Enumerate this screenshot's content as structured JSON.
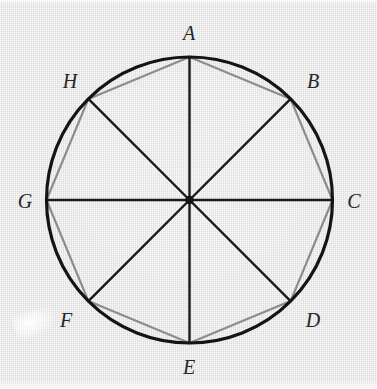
{
  "figure": {
    "background_color": "#e3e3e3",
    "circle": {
      "center_x": 189.5,
      "center_y": 200,
      "radius": 143,
      "stroke_color": "#141414",
      "stroke_width": 3.2
    },
    "radii": {
      "stroke_color": "#1a1a1a",
      "stroke_width": 2.4,
      "count": 8
    },
    "octagon": {
      "stroke_color": "#8c8c8c",
      "stroke_width": 2.2,
      "fill": "none",
      "sides": 8
    },
    "center_point": {
      "label": "",
      "x": 189.5,
      "y": 200,
      "radius": 4.2,
      "color": "#141414"
    },
    "vertices": [
      {
        "label": "A",
        "angle_deg": 90,
        "x": 189.5,
        "y": 57,
        "label_x": 189,
        "label_y": 33
      },
      {
        "label": "B",
        "angle_deg": 45,
        "x": 290.6,
        "y": 98.9,
        "label_x": 313,
        "label_y": 81
      },
      {
        "label": "C",
        "angle_deg": 0,
        "x": 332.5,
        "y": 200,
        "label_x": 354,
        "label_y": 201
      },
      {
        "label": "D",
        "angle_deg": 315,
        "x": 290.6,
        "y": 301.1,
        "label_x": 313,
        "label_y": 320
      },
      {
        "label": "E",
        "angle_deg": 270,
        "x": 189.5,
        "y": 343,
        "label_x": 189,
        "label_y": 367
      },
      {
        "label": "F",
        "angle_deg": 225,
        "x": 88.4,
        "y": 301.1,
        "label_x": 66,
        "label_y": 320
      },
      {
        "label": "G",
        "angle_deg": 180,
        "x": 46.5,
        "y": 200,
        "label_x": 25,
        "label_y": 201
      },
      {
        "label": "H",
        "angle_deg": 135,
        "x": 88.4,
        "y": 98.9,
        "label_x": 70,
        "label_y": 81
      }
    ]
  }
}
